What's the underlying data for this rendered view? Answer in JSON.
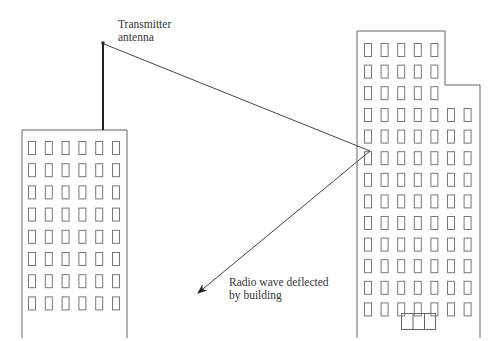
{
  "diagram": {
    "labels": {
      "transmitter_line1": "Transmitter",
      "transmitter_line2": "antenna",
      "deflected_line1": "Radio wave deflected",
      "deflected_line2": "by building"
    },
    "colors": {
      "line": "#555555",
      "window": "#777777",
      "antenna": "#222222",
      "text": "#333333"
    },
    "left_building": {
      "window_columns": 6,
      "window_rows": 8
    },
    "right_building": {
      "upper_window_columns": 5,
      "upper_window_rows": 3,
      "lower_window_columns": 7,
      "lower_window_rows": 10,
      "door_panels": 3
    }
  }
}
